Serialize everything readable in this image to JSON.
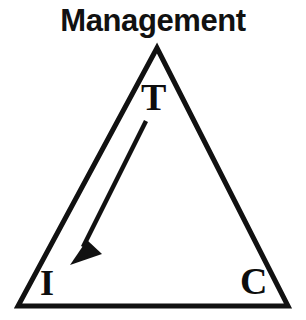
{
  "diagram": {
    "title": "Management",
    "type": "triangle-diagram",
    "background_color": "#ffffff",
    "stroke_color": "#111111",
    "vertices": [
      {
        "id": "top",
        "label": "T",
        "x": 157,
        "y": 48
      },
      {
        "id": "bottom-left",
        "label": "I",
        "x": 18,
        "y": 306
      },
      {
        "id": "bottom-right",
        "label": "C",
        "x": 288,
        "y": 306
      }
    ],
    "labels": {
      "top": "T",
      "bottom_left": "I",
      "bottom_right": "C"
    },
    "arrow": {
      "from": "T",
      "to": "I",
      "direction": "down-left",
      "start": {
        "x": 146,
        "y": 121
      },
      "end": {
        "x": 72,
        "y": 263
      }
    }
  }
}
